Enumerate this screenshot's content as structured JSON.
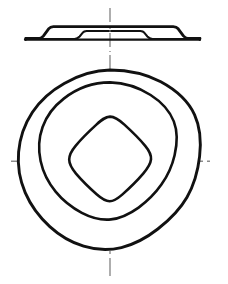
{
  "drawing": {
    "title": "Disc Spring / Conical Washer Technical Drawing",
    "sheet": {
      "width": 228,
      "height": 284,
      "background_color": "#ffffff"
    },
    "line_styles": {
      "object_line_color": "#111111",
      "object_line_width": 2.6,
      "centerline_color": "#8c8c8c",
      "centerline_width": 1.4,
      "centerline_dash": "16 4 3 4"
    },
    "views": [
      {
        "id": "section-view",
        "name": "Side Section View",
        "position": "top",
        "description": "Thin flat annular band shown in section with a raised trapezoidal conical crown at the centre",
        "bounds": {
          "x": 25,
          "y": 22,
          "width": 175,
          "height": 18
        },
        "geometry": {
          "baseline_y": 39.5,
          "baseline_x_start": 25,
          "baseline_x_end": 200,
          "crown_top_y": 26.5,
          "crown_left_outer_x": 40,
          "crown_left_inner_x": 50,
          "crown_right_inner_x": 175,
          "crown_right_outer_x": 186,
          "inner_rib_left_x": 80,
          "inner_rib_right_x": 148,
          "rib_top_y": 30.5
        }
      },
      {
        "id": "plan-view",
        "name": "Plan View",
        "position": "bottom",
        "description": "Three concentric rounded polygon contours representing the outer rim, the mid conical transition and the central aperture",
        "center": {
          "x": 110,
          "y": 161
        },
        "contours": [
          {
            "id": "outer-rim",
            "name": "Outer Rim Contour",
            "shape": "rounded-polygon",
            "sides": 9,
            "radius": 91,
            "radius_variation": 4,
            "corner_radius": 26,
            "rotation_deg": -90,
            "stroke_width": 2.9
          },
          {
            "id": "mid-contour",
            "name": "Mid Conical Contour",
            "shape": "rounded-polygon",
            "sides": 8,
            "radius": 79,
            "radius_variation": 5,
            "corner_radius": 22,
            "rotation_deg": -90,
            "stroke_width": 2.6
          },
          {
            "id": "inner-aperture",
            "name": "Inner Aperture Contour",
            "shape": "rounded-square",
            "sides": 4,
            "radius": 46,
            "radius_variation": 2,
            "corner_radius": 16,
            "rotation_deg": -90,
            "stroke_width": 2.6
          }
        ],
        "centerlines": [
          {
            "id": "vertical-centerline",
            "name": "Vertical Centerline",
            "orientation": "vertical",
            "x": 110,
            "y_start": 8,
            "y_end": 276
          },
          {
            "id": "horizontal-centerline",
            "name": "Horizontal Centerline",
            "orientation": "horizontal",
            "y": 161,
            "x_start": 11,
            "x_end": 212
          }
        ]
      }
    ]
  }
}
